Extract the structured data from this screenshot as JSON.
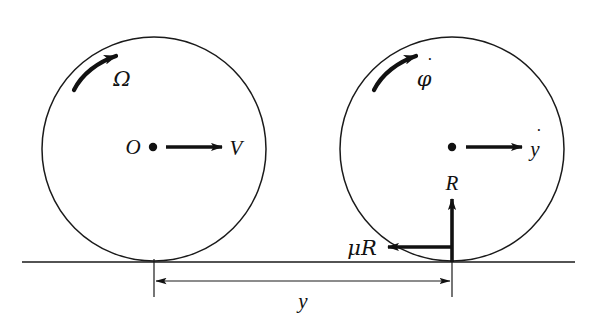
{
  "figure": {
    "colors": {
      "ink": "#111111",
      "line": "#1a1a1a",
      "background": "#ffffff"
    },
    "ground": {
      "name": "ground-line",
      "x1": 22,
      "x2": 575,
      "y": 262
    },
    "left_body": {
      "name": "left-disc",
      "cx": 154,
      "cy": 149,
      "r": 112,
      "center_label": "O",
      "spin_label": "Ω",
      "velocity_label": "V",
      "contact_x": 154
    },
    "right_body": {
      "name": "right-disc",
      "cx": 452,
      "cy": 149,
      "r": 112,
      "center_label": "",
      "spin_label": "φ",
      "spin_overdot": "·",
      "velocity_label": "y",
      "velocity_overdot": "·",
      "contact_x": 452
    },
    "forces": [
      {
        "name": "normal-reaction",
        "label": "R",
        "direction": "up",
        "x": 452,
        "y_tail": 262,
        "y_head": 199,
        "label_x": 452,
        "label_y": 190
      },
      {
        "name": "friction-force",
        "label": "μR",
        "direction": "left",
        "y": 247,
        "x_tail": 452,
        "x_head": 387,
        "label_x": 345,
        "label_y": 254
      }
    ],
    "dimension": {
      "name": "separation-dimension",
      "label": "y",
      "x1": 154,
      "x2": 452,
      "y": 281,
      "tick_top": 259,
      "tick_bottom": 297,
      "label_x": 303,
      "label_y": 306
    }
  }
}
